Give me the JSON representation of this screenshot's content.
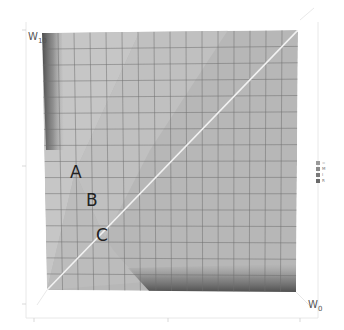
{
  "chart_data": {
    "type": "region-surface-3d",
    "title": "",
    "xlabel": "W0",
    "ylabel": "W10",
    "x_axis": {
      "label_main": "W",
      "label_sub": "0"
    },
    "y_axis": {
      "label_main": "W",
      "label_sub": "10"
    },
    "grid": {
      "on": true,
      "columns": 16,
      "rows": 16
    },
    "diagonal_line": {
      "from": [
        0,
        0
      ],
      "to": [
        1,
        1
      ],
      "color": "#eeeeee"
    },
    "regions": [
      {
        "name": "A",
        "label": "A",
        "description": "region left of first boundary"
      },
      {
        "name": "B",
        "label": "B",
        "description": "band between boundaries"
      },
      {
        "name": "C",
        "label": "C",
        "description": "region right of second boundary"
      }
    ],
    "legend": {
      "position": "right",
      "entries": [
        {
          "marker": "",
          "text": "="
        },
        {
          "marker": "",
          "text": "M"
        },
        {
          "marker": "",
          "text": "I"
        },
        {
          "marker": "",
          "text": "R"
        }
      ]
    }
  },
  "colors": {
    "surface": "#b9b9b9",
    "surface_light": "#cdcdcd",
    "band": "#c4c4c4",
    "grid": "#6f6f6f",
    "shadow": "#555555",
    "frame": "#dddddd",
    "diagonal": "#f2f2f2"
  }
}
